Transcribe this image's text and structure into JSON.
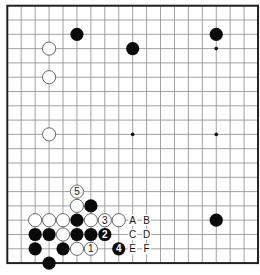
{
  "diagram": {
    "type": "go-board",
    "size": 19,
    "colors": {
      "background": "#ffffff",
      "grid": "#8a8a8a",
      "border": "#222222",
      "black_stone": "#0a0a0a",
      "white_stone": "#ffffff",
      "white_outline": "#555555"
    },
    "star_points": [
      [
        3,
        3
      ],
      [
        9,
        3
      ],
      [
        15,
        3
      ],
      [
        3,
        9
      ],
      [
        9,
        9
      ],
      [
        15,
        9
      ],
      [
        3,
        15
      ],
      [
        9,
        15
      ],
      [
        15,
        15
      ]
    ],
    "stones": [
      {
        "color": "black",
        "col": 5,
        "row": 2
      },
      {
        "color": "black",
        "col": 9,
        "row": 3
      },
      {
        "color": "black",
        "col": 15,
        "row": 2
      },
      {
        "color": "white",
        "col": 3,
        "row": 3
      },
      {
        "color": "white",
        "col": 3,
        "row": 5
      },
      {
        "color": "white",
        "col": 3,
        "row": 9
      },
      {
        "color": "black",
        "col": 15,
        "row": 15
      },
      {
        "color": "white",
        "col": 5,
        "row": 13,
        "label": "5"
      },
      {
        "color": "white",
        "col": 5,
        "row": 14
      },
      {
        "color": "black",
        "col": 6,
        "row": 14
      },
      {
        "color": "white",
        "col": 2,
        "row": 15
      },
      {
        "color": "white",
        "col": 3,
        "row": 15
      },
      {
        "color": "white",
        "col": 4,
        "row": 15
      },
      {
        "color": "black",
        "col": 5,
        "row": 15
      },
      {
        "color": "white",
        "col": 6,
        "row": 15
      },
      {
        "color": "white",
        "col": 7,
        "row": 15,
        "label": "3"
      },
      {
        "color": "white",
        "col": 8,
        "row": 15
      },
      {
        "color": "black",
        "col": 2,
        "row": 16
      },
      {
        "color": "black",
        "col": 3,
        "row": 16
      },
      {
        "color": "white",
        "col": 4,
        "row": 16
      },
      {
        "color": "black",
        "col": 5,
        "row": 16
      },
      {
        "color": "black",
        "col": 6,
        "row": 16
      },
      {
        "color": "black",
        "col": 7,
        "row": 16,
        "label": "2"
      },
      {
        "color": "black",
        "col": 2,
        "row": 17
      },
      {
        "color": "black",
        "col": 4,
        "row": 17
      },
      {
        "color": "white",
        "col": 5,
        "row": 17
      },
      {
        "color": "white",
        "col": 6,
        "row": 17,
        "label": "1"
      },
      {
        "color": "black",
        "col": 8,
        "row": 17,
        "label": "4"
      },
      {
        "color": "black",
        "col": 3,
        "row": 18
      }
    ],
    "letter_labels": [
      {
        "text": "A",
        "col": 9,
        "row": 15
      },
      {
        "text": "B",
        "col": 10,
        "row": 15
      },
      {
        "text": "C",
        "col": 9,
        "row": 16
      },
      {
        "text": "D",
        "col": 10,
        "row": 16
      },
      {
        "text": "E",
        "col": 9,
        "row": 17
      },
      {
        "text": "F",
        "col": 10,
        "row": 17
      }
    ]
  }
}
